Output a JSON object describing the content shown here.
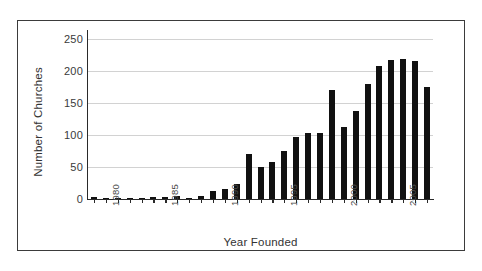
{
  "chart_data": {
    "type": "bar",
    "title": "",
    "xlabel": "Year Founded",
    "ylabel": "Number of Churches",
    "ylim": [
      0,
      260
    ],
    "ytick_labels": [
      "0",
      "50",
      "100",
      "150",
      "200",
      "250"
    ],
    "ytick_values": [
      0,
      50,
      100,
      150,
      200,
      250
    ],
    "xtick_labels": [
      "1980",
      "1985",
      "1990",
      "1995",
      "2000",
      "2005"
    ],
    "xtick_values": [
      1980,
      1985,
      1990,
      1995,
      2000,
      2005
    ],
    "grid": true,
    "legend": "none",
    "bar_color": "#111111",
    "grid_color": "#d2d2d2",
    "axis_color": "#2a2a2a",
    "frame_color": "#3b3b3b",
    "categories": [
      1979,
      1980,
      1981,
      1982,
      1983,
      1984,
      1985,
      1986,
      1987,
      1988,
      1989,
      1990,
      1991,
      1992,
      1993,
      1994,
      1995,
      1996,
      1997,
      1998,
      1999,
      2000,
      2001,
      2002,
      2003,
      2004,
      2005,
      2006,
      2007
    ],
    "values": [
      3,
      1,
      2,
      1,
      1,
      3,
      3,
      4,
      2,
      5,
      13,
      15,
      24,
      70,
      50,
      58,
      75,
      97,
      104,
      104,
      171,
      113,
      138,
      180,
      208,
      217,
      220,
      216,
      176
    ]
  },
  "axes": {
    "y_title": "Number of Churches",
    "x_title": "Year Founded"
  }
}
